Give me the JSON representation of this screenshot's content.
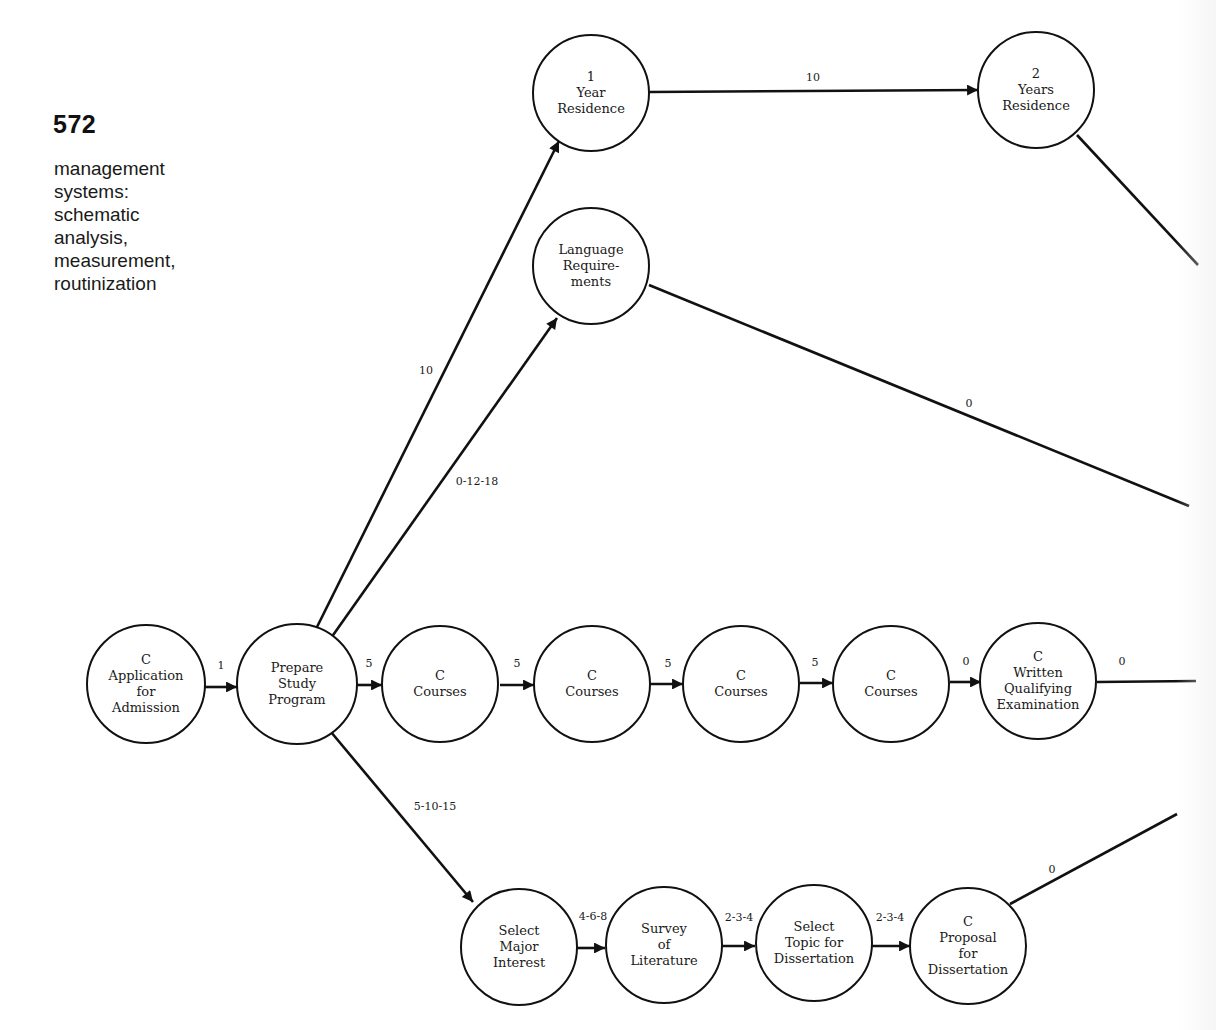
{
  "page": {
    "number": "572",
    "section_title_lines": [
      "management",
      "systems:",
      "schematic",
      "analysis,",
      "measurement,",
      "routinization"
    ]
  },
  "diagram": {
    "nodes": [
      {
        "id": "application",
        "cx": 146,
        "cy": 684,
        "r": 59,
        "lines": [
          "C",
          "Application",
          "for",
          "Admission"
        ]
      },
      {
        "id": "prepare",
        "cx": 297,
        "cy": 684,
        "r": 60,
        "lines": [
          "Prepare",
          "Study",
          "Program"
        ]
      },
      {
        "id": "courses1",
        "cx": 440,
        "cy": 684,
        "r": 58,
        "lines": [
          "C",
          "Courses"
        ]
      },
      {
        "id": "courses2",
        "cx": 592,
        "cy": 684,
        "r": 58,
        "lines": [
          "C",
          "Courses"
        ]
      },
      {
        "id": "courses3",
        "cx": 741,
        "cy": 684,
        "r": 58,
        "lines": [
          "C",
          "Courses"
        ]
      },
      {
        "id": "courses4",
        "cx": 891,
        "cy": 684,
        "r": 58,
        "lines": [
          "C",
          "Courses"
        ]
      },
      {
        "id": "written-exam",
        "cx": 1038,
        "cy": 681,
        "r": 58,
        "lines": [
          "C",
          "Written",
          "Qualifying",
          "Examination"
        ]
      },
      {
        "id": "year1",
        "cx": 591,
        "cy": 93,
        "r": 58,
        "lines": [
          "1",
          "Year",
          "Residence"
        ]
      },
      {
        "id": "years2",
        "cx": 1036,
        "cy": 90,
        "r": 58,
        "lines": [
          "2",
          "Years",
          "Residence"
        ]
      },
      {
        "id": "language",
        "cx": 591,
        "cy": 266,
        "r": 58,
        "lines": [
          "Language",
          "Require-",
          "ments"
        ]
      },
      {
        "id": "select-major",
        "cx": 519,
        "cy": 947,
        "r": 58,
        "lines": [
          "Select",
          "Major",
          "Interest"
        ]
      },
      {
        "id": "survey",
        "cx": 664,
        "cy": 945,
        "r": 58,
        "lines": [
          "Survey",
          "of",
          "Literature"
        ]
      },
      {
        "id": "select-topic",
        "cx": 814,
        "cy": 943,
        "r": 58,
        "lines": [
          "Select",
          "Topic for",
          "Dissertation"
        ]
      },
      {
        "id": "proposal",
        "cx": 968,
        "cy": 946,
        "r": 58,
        "lines": [
          "C",
          "Proposal",
          "for",
          "Dissertation"
        ]
      }
    ],
    "edges": [
      {
        "from": "application",
        "to": "prepare",
        "label": "1",
        "x1": 205,
        "y1": 687,
        "x2": 237,
        "y2": 687,
        "arrow": true,
        "lx": 221,
        "ly": 669
      },
      {
        "from": "prepare",
        "to": "courses1",
        "label": "5",
        "x1": 357,
        "y1": 685,
        "x2": 382,
        "y2": 685,
        "arrow": true,
        "lx": 369,
        "ly": 667
      },
      {
        "from": "courses1",
        "to": "courses2",
        "label": "5",
        "x1": 500,
        "y1": 685,
        "x2": 534,
        "y2": 685,
        "arrow": true,
        "lx": 517,
        "ly": 667
      },
      {
        "from": "courses2",
        "to": "courses3",
        "label": "5",
        "x1": 650,
        "y1": 684,
        "x2": 683,
        "y2": 684,
        "arrow": true,
        "lx": 668,
        "ly": 667
      },
      {
        "from": "courses3",
        "to": "courses4",
        "label": "5",
        "x1": 800,
        "y1": 683,
        "x2": 833,
        "y2": 683,
        "arrow": true,
        "lx": 815,
        "ly": 666
      },
      {
        "from": "courses4",
        "to": "written-exam",
        "label": "0",
        "x1": 950,
        "y1": 682,
        "x2": 981,
        "y2": 682,
        "arrow": true,
        "lx": 966,
        "ly": 665
      },
      {
        "from": "written-exam",
        "to": "offpage",
        "label": "0",
        "x1": 1097,
        "y1": 682,
        "x2": 1196,
        "y2": 681,
        "arrow": false,
        "lx": 1122,
        "ly": 665
      },
      {
        "from": "prepare",
        "to": "year1",
        "label": "10",
        "x1": 315,
        "y1": 631,
        "x2": 559,
        "y2": 141,
        "arrow": true,
        "lx": 426,
        "ly": 374
      },
      {
        "from": "prepare",
        "to": "language",
        "label": "0-12-18",
        "x1": 331,
        "y1": 638,
        "x2": 557,
        "y2": 318,
        "arrow": true,
        "lx": 477,
        "ly": 485
      },
      {
        "from": "year1",
        "to": "years2",
        "label": "10",
        "x1": 649,
        "y1": 92,
        "x2": 978,
        "y2": 90,
        "arrow": true,
        "lx": 813,
        "ly": 81
      },
      {
        "from": "years2",
        "to": "offpage",
        "label": "",
        "x1": 1077,
        "y1": 135,
        "x2": 1198,
        "y2": 265,
        "arrow": false,
        "lx": 0,
        "ly": 0
      },
      {
        "from": "language",
        "to": "offpage",
        "label": "0",
        "x1": 649,
        "y1": 285,
        "x2": 1189,
        "y2": 506,
        "arrow": false,
        "lx": 969,
        "ly": 407
      },
      {
        "from": "prepare",
        "to": "select-major",
        "label": "5-10-15",
        "x1": 331,
        "y1": 732,
        "x2": 473,
        "y2": 902,
        "arrow": true,
        "lx": 435,
        "ly": 810
      },
      {
        "from": "select-major",
        "to": "survey",
        "label": "4-6-8",
        "x1": 577,
        "y1": 948,
        "x2": 605,
        "y2": 948,
        "arrow": true,
        "lx": 593,
        "ly": 920
      },
      {
        "from": "survey",
        "to": "select-topic",
        "label": "2-3-4",
        "x1": 722,
        "y1": 946,
        "x2": 755,
        "y2": 946,
        "arrow": true,
        "lx": 739,
        "ly": 921
      },
      {
        "from": "select-topic",
        "to": "proposal",
        "label": "2-3-4",
        "x1": 872,
        "y1": 946,
        "x2": 910,
        "y2": 946,
        "arrow": true,
        "lx": 890,
        "ly": 921
      },
      {
        "from": "proposal",
        "to": "offpage",
        "label": "0",
        "x1": 1010,
        "y1": 904,
        "x2": 1177,
        "y2": 814,
        "arrow": false,
        "lx": 1052,
        "ly": 873
      }
    ]
  }
}
